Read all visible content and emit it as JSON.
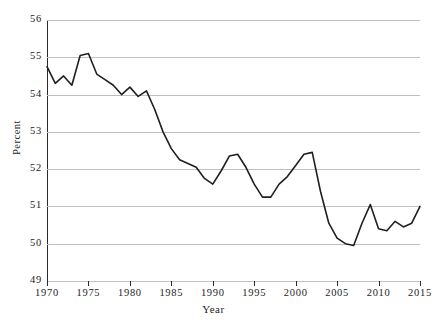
{
  "figure": {
    "cropped_header_text": "",
    "background_color": "#ffffff",
    "line_color": "#1f1f1f",
    "grid_color": "#bfbfbf",
    "axis_color": "#2a2a2a"
  },
  "chart_data": {
    "type": "line",
    "title": "",
    "xlabel": "Year",
    "ylabel": "Percent",
    "xlim": [
      1970,
      2015
    ],
    "ylim": [
      49,
      56
    ],
    "grid": "horizontal",
    "legend": "none",
    "xticks": [
      1970,
      1975,
      1980,
      1985,
      1990,
      1995,
      2000,
      2005,
      2010,
      2015
    ],
    "xtick_labels": [
      "1970",
      "1975",
      "1980",
      "1985",
      "1990",
      "1995",
      "2000",
      "2005",
      "2010",
      "2015"
    ],
    "yticks": [
      49,
      50,
      51,
      52,
      53,
      54,
      55,
      56
    ],
    "ytick_labels": [
      "49",
      "50",
      "51",
      "52",
      "53",
      "54",
      "55",
      "56"
    ],
    "series": [
      {
        "name": "Percent",
        "x": [
          1970,
          1971,
          1972,
          1973,
          1974,
          1975,
          1976,
          1977,
          1978,
          1979,
          1980,
          1981,
          1982,
          1983,
          1984,
          1985,
          1986,
          1987,
          1988,
          1989,
          1990,
          1991,
          1992,
          1993,
          1994,
          1995,
          1996,
          1997,
          1998,
          1999,
          2000,
          2001,
          2002,
          2003,
          2004,
          2005,
          2006,
          2007,
          2008,
          2009,
          2010,
          2011,
          2012,
          2013,
          2014,
          2015
        ],
        "values": [
          54.75,
          54.3,
          54.5,
          54.25,
          55.05,
          55.1,
          54.55,
          54.4,
          54.25,
          54.0,
          54.2,
          53.95,
          54.1,
          53.6,
          53.0,
          52.55,
          52.25,
          52.15,
          52.05,
          51.75,
          51.6,
          51.95,
          52.35,
          52.4,
          52.05,
          51.6,
          51.25,
          51.25,
          51.6,
          51.8,
          52.1,
          52.4,
          52.45,
          51.4,
          50.55,
          50.15,
          50.0,
          49.95,
          50.55,
          51.05,
          50.4,
          50.35,
          50.6,
          50.45,
          50.55,
          51.0
        ]
      }
    ]
  },
  "axis": {
    "y_label": "Percent",
    "x_label": "Year"
  }
}
